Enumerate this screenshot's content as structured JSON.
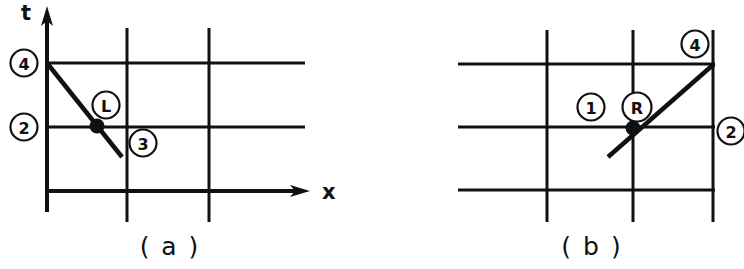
{
  "figure": {
    "background_color": "#ffffff",
    "line_color": "#111111",
    "width": 744,
    "height": 269
  },
  "panels": [
    {
      "id": "a",
      "caption": "( a )",
      "axes": {
        "x_label": "x",
        "t_label": "t",
        "x_axis_arrow": true,
        "t_axis_arrow": true
      },
      "grid": {
        "vertical_lines": 2,
        "horizontal_lines": 3
      },
      "characteristic": {
        "name": "left-going-characteristic",
        "direction": "down-right",
        "slope_sign": "negative"
      },
      "labels": [
        {
          "name": "node-4",
          "text": "4",
          "circled": true,
          "position": "left-axis-upper"
        },
        {
          "name": "node-2",
          "text": "2",
          "circled": true,
          "position": "left-axis-lower"
        },
        {
          "name": "state-L",
          "text": "L",
          "circled": true,
          "position": "above-intersection"
        },
        {
          "name": "node-3",
          "text": "3",
          "circled": true,
          "position": "below-right-of-intersection"
        }
      ]
    },
    {
      "id": "b",
      "caption": "( b )",
      "axes": {
        "x_label": "",
        "t_label": "",
        "x_axis_arrow": false,
        "t_axis_arrow": false
      },
      "grid": {
        "vertical_lines": 3,
        "horizontal_lines": 3
      },
      "characteristic": {
        "name": "right-going-characteristic",
        "direction": "up-right",
        "slope_sign": "positive"
      },
      "labels": [
        {
          "name": "node-4",
          "text": "4",
          "circled": true,
          "position": "top-right"
        },
        {
          "name": "node-2",
          "text": "2",
          "circled": true,
          "position": "right-of-middle-row"
        },
        {
          "name": "state-1",
          "text": "1",
          "circled": true,
          "position": "left-of-intersection"
        },
        {
          "name": "state-R",
          "text": "R",
          "circled": true,
          "position": "above-intersection"
        }
      ]
    }
  ]
}
